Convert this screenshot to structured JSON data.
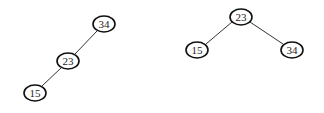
{
  "diagram": {
    "type": "binary-search-trees",
    "trees": [
      {
        "name": "left-tree",
        "nodes": [
          {
            "id": "L34",
            "label": "34",
            "cx": 104,
            "cy": 24
          },
          {
            "id": "L23",
            "label": "23",
            "cx": 68,
            "cy": 61
          },
          {
            "id": "L15",
            "label": "15",
            "cx": 35,
            "cy": 93
          }
        ],
        "edges": [
          {
            "from": "L34",
            "to": "L23"
          },
          {
            "from": "L23",
            "to": "L15"
          }
        ]
      },
      {
        "name": "right-tree",
        "nodes": [
          {
            "id": "R23",
            "label": "23",
            "cx": 241,
            "cy": 17
          },
          {
            "id": "R15",
            "label": "15",
            "cx": 197,
            "cy": 50
          },
          {
            "id": "R34",
            "label": "34",
            "cx": 292,
            "cy": 50
          }
        ],
        "edges": [
          {
            "from": "R23",
            "to": "R15"
          },
          {
            "from": "R23",
            "to": "R34"
          }
        ]
      }
    ]
  },
  "labels": {
    "left_34": "34",
    "left_23": "23",
    "left_15": "15",
    "right_23": "23",
    "right_15": "15",
    "right_34": "34"
  }
}
